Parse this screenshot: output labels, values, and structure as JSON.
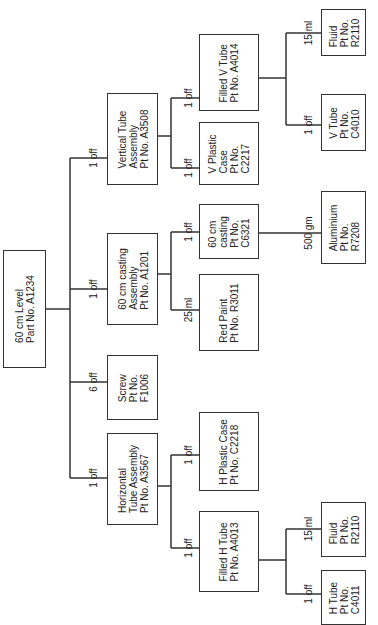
{
  "diagram": {
    "type": "product structure tree",
    "orientation": "rotated 90 degrees counter-clockwise",
    "nodes": {
      "root": {
        "name": "60 cm Level",
        "part": "Part No. A1234"
      },
      "vta": {
        "name": "Vertical Tube\nAssembly",
        "part": "Pt No. A3508",
        "qty": "1 off"
      },
      "fvt": {
        "name": "Filled V Tube",
        "part": "Pt No. A4014",
        "qty": "1 off"
      },
      "vpc": {
        "name": "V Plastic\nCase",
        "part": "Pt No.\nC2217",
        "qty": "1 off"
      },
      "fluid1": {
        "name": "Fluid",
        "part": "Pt No.\nR2110",
        "qty": "15 ml"
      },
      "vtube": {
        "name": "V Tube",
        "part": "Pt No.\nC4010",
        "qty": "1 off"
      },
      "cca": {
        "name": "60 cm casting\nAssembly",
        "part": "Pt No. A1201",
        "qty": "1 off"
      },
      "casting": {
        "name": "60 cm\ncasting",
        "part": "Pt No.\nC6321",
        "qty": "1 off"
      },
      "paint": {
        "name": "Red Paint",
        "part": "Pt No. R3011",
        "qty": "25 ml"
      },
      "alu": {
        "name": "Aluminium",
        "part": "Pt No.\nR7208",
        "qty": "500 gm"
      },
      "screw": {
        "name": "Screw",
        "part": "Pt No.\nF1006",
        "qty": "6 off"
      },
      "hta": {
        "name": "Horizontal\nTube Assembly",
        "part": "Pt No. A3567",
        "qty": "1 off"
      },
      "hpc": {
        "name": "H Plastic Case",
        "part": "Pt No. C2218",
        "qty": "1 off"
      },
      "fht": {
        "name": "Filled H Tube",
        "part": "Pt No. A4013",
        "qty": "1 off"
      },
      "fluid2": {
        "name": "Fluid",
        "part": "Pt No.\nR2110",
        "qty": "15 ml"
      },
      "htube": {
        "name": "H Tube",
        "part": "Pt No.\nC4011",
        "qty": "1 off"
      }
    },
    "labels": {
      "root": "60 cm Level\nPart No. A1234",
      "vta": "Vertical Tube\nAssembly\nPt No. A3508",
      "fvt": "Filled V Tube\nPt No. A4014",
      "vpc": "V Plastic\nCase\nPt No.\nC2217",
      "fluid1": "Fluid\nPt No.\nR2110",
      "vtube": "V Tube\nPt No.\nC4010",
      "cca": "60 cm casting\nAssembly\nPt No. A1201",
      "casting": "60 cm\ncasting\nPt No.\nC6321",
      "paint": "Red Paint\nPt No. R3011",
      "alu": "Aluminium\nPt No.\nR7208",
      "screw": "Screw\nPt No.\nF1006",
      "hta": "Horizontal\nTube Assembly\nPt No. A3567",
      "hpc": "H Plastic Case\nPt No. C2218",
      "fht": "Filled H Tube\nPt No. A4013",
      "fluid2": "Fluid\nPt No.\nR2110",
      "htube": "H Tube\nPt No.\nC4011"
    },
    "quantities": {
      "vta": "1 off",
      "cca": "1 off",
      "screw": "6 off",
      "hta": "1 off",
      "fvt": "1 off",
      "vpc": "1 off",
      "fluid1": "15 ml",
      "vtube": "1 off",
      "casting": "1 off",
      "paint": "25 ml",
      "alu": "500 gm",
      "hpc": "1 off",
      "fht": "1 off",
      "fluid2": "15 ml",
      "htube": "1 off"
    }
  }
}
